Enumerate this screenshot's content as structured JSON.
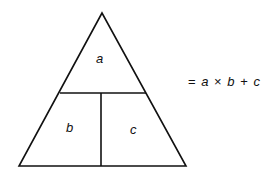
{
  "diagram": {
    "type": "formula-triangle",
    "cells": {
      "top": "a",
      "bottom_left": "b",
      "bottom_right": "c"
    },
    "formula": {
      "equals": "=",
      "a": "a",
      "times": "×",
      "b": "b",
      "plus": "+",
      "c": "c"
    },
    "colors": {
      "line": "#111111",
      "background": "#ffffff"
    }
  }
}
